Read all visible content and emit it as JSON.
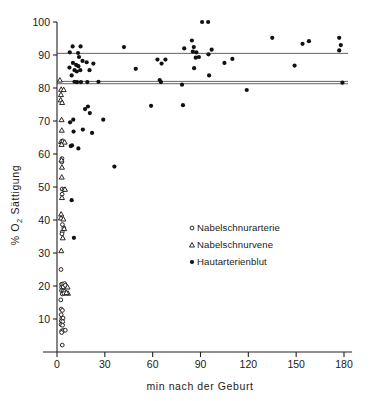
{
  "chart_data": {
    "type": "scatter",
    "title": "",
    "xlabel": "min  nach der Geburt",
    "ylabel": "% O2 Sättigung",
    "ylabel_prefix": "%",
    "ylabel_o": "O",
    "ylabel_sub": "2",
    "ylabel_rest": "Sättigung",
    "xlim": [
      0,
      180
    ],
    "ylim": [
      0,
      100
    ],
    "xticks": [
      0,
      30,
      60,
      90,
      120,
      150,
      180
    ],
    "xticklabels": [
      "0",
      "30",
      "60",
      "90",
      "120",
      "150",
      "180"
    ],
    "yticks": [
      10,
      20,
      30,
      40,
      50,
      60,
      70,
      80,
      90,
      100
    ],
    "yticklabels": [
      "10",
      "20",
      "30",
      "40",
      "50",
      "60",
      "70",
      "80",
      "90",
      "100"
    ],
    "grid": false,
    "legend_position": "center-right",
    "reference_lines": [
      {
        "y": 90.5,
        "name": "mean-line-upper"
      },
      {
        "y": 82.0,
        "name": "mean-line-mid"
      },
      {
        "y": 81.3,
        "name": "mean-line-lower"
      }
    ],
    "series": [
      {
        "name": "Nabelschnurarterie",
        "marker": "open-circle",
        "points": [
          [
            2.5,
            25.0
          ],
          [
            2.8,
            20.5
          ],
          [
            3.6,
            20.6
          ],
          [
            4.8,
            20.7
          ],
          [
            2.9,
            19.6
          ],
          [
            3.9,
            19.7
          ],
          [
            5.2,
            20.2
          ],
          [
            2.8,
            18.6
          ],
          [
            3.8,
            18.5
          ],
          [
            4.7,
            18.3
          ],
          [
            3.3,
            17.6
          ],
          [
            4.4,
            17.7
          ],
          [
            2.4,
            15.8
          ],
          [
            2.6,
            13.0
          ],
          [
            3.4,
            12.6
          ],
          [
            2.6,
            11.3
          ],
          [
            3.0,
            10.2
          ],
          [
            3.8,
            10.3
          ],
          [
            2.7,
            9.4
          ],
          [
            3.6,
            9.2
          ],
          [
            2.6,
            8.3
          ],
          [
            3.5,
            8.1
          ],
          [
            3.0,
            6.4
          ],
          [
            4.0,
            6.5
          ],
          [
            5.2,
            6.6
          ],
          [
            2.9,
            5.9
          ],
          [
            3.3,
            2.1
          ],
          [
            3.2,
            49.4
          ],
          [
            4.4,
            49.2
          ],
          [
            3.2,
            47.8
          ],
          [
            3.1,
            58.6
          ],
          [
            3.0,
            57.6
          ],
          [
            3.4,
            38.6
          ],
          [
            4.3,
            37.6
          ],
          [
            3.3,
            36.4
          ],
          [
            3.1,
            35.8
          ]
        ]
      },
      {
        "name": "Nabelschnurvene",
        "marker": "triangle",
        "points": [
          [
            1.8,
            82.4
          ],
          [
            2.6,
            79.6
          ],
          [
            4.2,
            79.5
          ],
          [
            2.5,
            78.0
          ],
          [
            2.3,
            76.4
          ],
          [
            3.2,
            75.6
          ],
          [
            2.9,
            70.4
          ],
          [
            3.0,
            67.2
          ],
          [
            2.6,
            63.8
          ],
          [
            3.6,
            63.9
          ],
          [
            4.8,
            63.6
          ],
          [
            2.9,
            62.9
          ],
          [
            2.8,
            58.2
          ],
          [
            3.1,
            56.0
          ],
          [
            3.0,
            53.0
          ],
          [
            5.0,
            49.3
          ],
          [
            3.1,
            46.8
          ],
          [
            2.6,
            41.8
          ],
          [
            2.5,
            40.6
          ],
          [
            4.0,
            40.3
          ],
          [
            4.5,
            37.4
          ],
          [
            3.6,
            34.6
          ],
          [
            2.7,
            30.7
          ],
          [
            6.6,
            19.7
          ],
          [
            6.9,
            17.8
          ],
          [
            5.9,
            18.0
          ]
        ]
      },
      {
        "name": "Hautarterienblut",
        "marker": "filled-circle",
        "points": [
          [
            9.8,
            92.6
          ],
          [
            8.0,
            90.8
          ],
          [
            14.8,
            92.6
          ],
          [
            13.2,
            90.6
          ],
          [
            13.8,
            89.4
          ],
          [
            10.0,
            87.6
          ],
          [
            7.8,
            86.2
          ],
          [
            12.0,
            87.0
          ],
          [
            13.4,
            86.6
          ],
          [
            11.0,
            85.4
          ],
          [
            12.4,
            85.0
          ],
          [
            14.6,
            85.4
          ],
          [
            16.0,
            88.2
          ],
          [
            18.6,
            87.8
          ],
          [
            20.4,
            85.4
          ],
          [
            22.8,
            87.4
          ],
          [
            9.2,
            83.8
          ],
          [
            11.0,
            81.9
          ],
          [
            12.6,
            81.8
          ],
          [
            15.0,
            81.8
          ],
          [
            19.0,
            81.8
          ],
          [
            26.0,
            81.9
          ],
          [
            10.4,
            66.8
          ],
          [
            8.6,
            62.4
          ],
          [
            9.4,
            62.6
          ],
          [
            13.4,
            61.7
          ],
          [
            8.2,
            69.6
          ],
          [
            10.2,
            70.4
          ],
          [
            17.6,
            73.6
          ],
          [
            19.4,
            74.4
          ],
          [
            20.6,
            72.4
          ],
          [
            16.2,
            67.4
          ],
          [
            22.0,
            66.4
          ],
          [
            9.2,
            46.0
          ],
          [
            10.6,
            34.6
          ],
          [
            29.0,
            70.4
          ],
          [
            36.0,
            56.2
          ],
          [
            42.0,
            92.4
          ],
          [
            49.4,
            85.8
          ],
          [
            59.0,
            74.6
          ],
          [
            63.0,
            88.6
          ],
          [
            68.0,
            88.6
          ],
          [
            65.6,
            87.4
          ],
          [
            64.4,
            82.4
          ],
          [
            65.2,
            81.8
          ],
          [
            78.4,
            81.0
          ],
          [
            79.0,
            74.8
          ],
          [
            79.8,
            92.0
          ],
          [
            84.6,
            94.4
          ],
          [
            85.8,
            92.4
          ],
          [
            85.2,
            91.0
          ],
          [
            87.4,
            90.8
          ],
          [
            87.0,
            89.2
          ],
          [
            89.0,
            89.4
          ],
          [
            86.0,
            86.0
          ],
          [
            91.0,
            100.0
          ],
          [
            94.8,
            100.0
          ],
          [
            95.0,
            90.2
          ],
          [
            97.0,
            91.6
          ],
          [
            95.4,
            83.8
          ],
          [
            105.0,
            87.6
          ],
          [
            110.0,
            88.8
          ],
          [
            119.0,
            79.4
          ],
          [
            135.0,
            95.2
          ],
          [
            149.0,
            86.8
          ],
          [
            154.0,
            93.4
          ],
          [
            158.0,
            94.2
          ],
          [
            177.0,
            95.2
          ],
          [
            178.0,
            93.0
          ],
          [
            177.0,
            91.4
          ],
          [
            179.0,
            81.6
          ]
        ]
      }
    ],
    "legend": [
      {
        "label": "Nabelschnurarterie",
        "marker": "open-circle"
      },
      {
        "label": "Nabelschnurvene",
        "marker": "triangle"
      },
      {
        "label": "Hautarterienblut",
        "marker": "filled-circle"
      }
    ]
  }
}
